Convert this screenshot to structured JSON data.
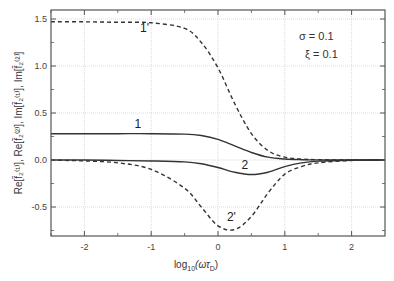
{
  "chart_data": {
    "type": "line",
    "title": "",
    "xlabel": "log10(ωτD)",
    "ylabel": "Re[f2(1)], Re[f2(2)], Im[f2(1)], Im[f2(2)]",
    "xlim": [
      -2.5,
      2.5
    ],
    "ylim": [
      -0.8,
      1.6
    ],
    "grid": true,
    "x_ticks": [
      "-2",
      "-1",
      "0",
      "1",
      "2"
    ],
    "y_ticks": [
      "-0.5",
      "0.0",
      "0.5",
      "1.0",
      "1.5"
    ],
    "annotations": [
      "σ = 0.1",
      "ξ = 0.1"
    ],
    "x": [
      -2.5,
      -2,
      -1.5,
      -1,
      -0.5,
      -0.25,
      0,
      0.25,
      0.5,
      0.75,
      1,
      1.25,
      1.5,
      2,
      2.5
    ],
    "series": [
      {
        "name": "1",
        "style": "solid",
        "values": [
          0.28,
          0.28,
          0.28,
          0.28,
          0.275,
          0.26,
          0.22,
          0.15,
          0.08,
          0.03,
          0.01,
          0.003,
          0.001,
          0.0,
          0.0
        ]
      },
      {
        "name": "2",
        "style": "solid",
        "values": [
          0.0,
          0.0,
          -0.005,
          -0.01,
          -0.02,
          -0.04,
          -0.08,
          -0.13,
          -0.155,
          -0.13,
          -0.07,
          -0.03,
          -0.012,
          -0.002,
          0.0
        ]
      },
      {
        "name": "1'",
        "style": "dashed",
        "values": [
          1.47,
          1.47,
          1.465,
          1.46,
          1.4,
          1.25,
          0.98,
          0.6,
          0.28,
          0.1,
          0.03,
          0.01,
          0.003,
          0.0,
          0.0
        ]
      },
      {
        "name": "2'",
        "style": "dashed",
        "values": [
          0.0,
          -0.01,
          -0.03,
          -0.1,
          -0.3,
          -0.5,
          -0.7,
          -0.74,
          -0.6,
          -0.35,
          -0.15,
          -0.07,
          -0.03,
          -0.005,
          0.0
        ]
      }
    ],
    "curve_labels": [
      {
        "text": "1'",
        "x": -1.1,
        "y": 1.36
      },
      {
        "text": "1",
        "x": -1.2,
        "y": 0.34
      },
      {
        "text": "2",
        "x": 0.4,
        "y": -0.1
      },
      {
        "text": "2'",
        "x": 0.2,
        "y": -0.65
      }
    ]
  },
  "labels": {
    "xlabel_main": "log",
    "xlabel_sub": "10",
    "xlabel_paren": "(ωτ",
    "xlabel_sub2": "D",
    "xlabel_close": ")",
    "ylabel": "Re[f̄₂⁽¹⁾], Re[f̄₂⁽²⁾], Im[f̄₂⁽¹⁾], Im[f̄₂⁽²⁾]",
    "sigma": "σ = 0.1",
    "xi": "ξ = 0.1"
  }
}
